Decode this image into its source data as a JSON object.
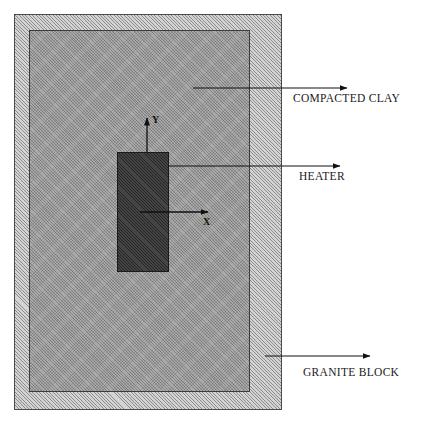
{
  "diagram": {
    "regions": [
      {
        "id": "granite-block",
        "label": "GRANITE BLOCK",
        "fill": "#c9c9c9",
        "pattern": "hatched"
      },
      {
        "id": "compacted-clay",
        "label": "COMPACTED CLAY",
        "fill": "#9a9a9a",
        "pattern": "speckled"
      },
      {
        "id": "heater",
        "label": "HEATER",
        "fill": "#3a3a3a",
        "pattern": "solid-dark"
      }
    ],
    "callouts": {
      "compacted_clay": "COMPACTED CLAY",
      "heater": "HEATER",
      "granite_block": "GRANITE BLOCK"
    },
    "axes": {
      "y_label": "Y",
      "x_label": "X",
      "origin_description": "lower-right interior of heater block"
    },
    "line_color": "#111111"
  }
}
